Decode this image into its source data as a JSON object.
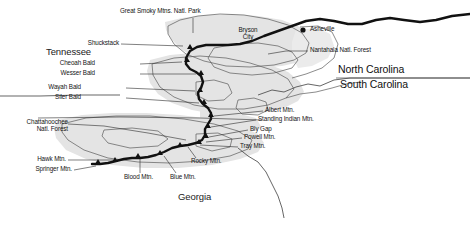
{
  "map": {
    "title": "Appalachian Trail — Southern Section",
    "background_color": "#ffffff",
    "land_fill": "#e2e2e2",
    "land_stroke": "#4a4a4a",
    "trail_color": "#111111",
    "leader_color": "#2b2b2b",
    "text_color": "#141414"
  },
  "states": [
    {
      "name": "Tennessee",
      "x": 46,
      "y": 52,
      "align": "left"
    },
    {
      "name": "North Carolina",
      "x": 338,
      "y": 70,
      "align": "left"
    },
    {
      "name": "South Carolina",
      "x": 340,
      "y": 85,
      "align": "left"
    },
    {
      "name": "Georgia",
      "x": 178,
      "y": 197,
      "align": "left"
    }
  ],
  "cities": [
    {
      "name": "Bryson\nCity",
      "x": 247,
      "y": 33,
      "align": "center",
      "marker": false
    },
    {
      "name": "Asheville",
      "x": 311,
      "y": 27,
      "align": "left",
      "marker": true,
      "marker_x": 303,
      "marker_y": 30
    }
  ],
  "areas": [
    {
      "name": "Great Smoky Mtns. Natl. Park",
      "x": 120,
      "y": 11,
      "align": "left"
    },
    {
      "name": "Nantahala Natl. Forest",
      "x": 310,
      "y": 50,
      "align": "left"
    },
    {
      "name": "Chattahoochee\nNatl. Forest",
      "x": 28,
      "y": 124,
      "align": "right"
    }
  ],
  "trail_features": [
    {
      "name": "Shuckstack",
      "x": 119,
      "y": 44,
      "align": "right"
    },
    {
      "name": "Cheoah Bald",
      "x": 95,
      "y": 64,
      "align": "right"
    },
    {
      "name": "Wesser Bald",
      "x": 95,
      "y": 74,
      "align": "right"
    },
    {
      "name": "Wayah Bald",
      "x": 81,
      "y": 88,
      "align": "right"
    },
    {
      "name": "Siler Bald",
      "x": 81,
      "y": 98,
      "align": "right"
    },
    {
      "name": "Albert Mtn.",
      "x": 265,
      "y": 110,
      "align": "left"
    },
    {
      "name": "Standing Indian Mtn.",
      "x": 258,
      "y": 119,
      "align": "left"
    },
    {
      "name": "Bly Gap",
      "x": 250,
      "y": 129,
      "align": "left"
    },
    {
      "name": "Powell Mtn.",
      "x": 244,
      "y": 137,
      "align": "left"
    },
    {
      "name": "Tray Mtn.",
      "x": 240,
      "y": 146,
      "align": "left"
    },
    {
      "name": "Rocky Mtn.",
      "x": 191,
      "y": 161,
      "align": "left"
    },
    {
      "name": "Blue Mtn.",
      "x": 170,
      "y": 177,
      "align": "left"
    },
    {
      "name": "Blood Mtn.",
      "x": 124,
      "y": 177,
      "align": "left"
    },
    {
      "name": "Hawk Mtn.",
      "x": 66,
      "y": 160,
      "align": "right"
    },
    {
      "name": "Springer Mtn.",
      "x": 72,
      "y": 170,
      "align": "right"
    }
  ],
  "legend": {
    "trail_label": "Appalachian Trail",
    "boundary_label": "State boundary"
  }
}
